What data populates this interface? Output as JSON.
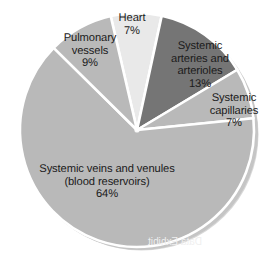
{
  "chart_data": {
    "type": "pie",
    "title": "",
    "subtitle": "",
    "xlabel": "",
    "ylabel": "",
    "grid": false,
    "legend_position": "none",
    "labels_inside_and_outside": true,
    "total_percent": 100,
    "units": "percent of total blood volume",
    "categories": [
      "Heart",
      "Systemic arteries and arterioles",
      "Systemic capillaries",
      "Systemic veins and venules (blood reservoirs)",
      "Pulmonary vessels"
    ],
    "values": [
      7,
      13,
      7,
      64,
      9
    ],
    "slices": [
      {
        "name": "Heart",
        "value": 7,
        "value_label": "7%",
        "label_lines": [
          "Heart"
        ],
        "color": "#e9e9e9",
        "start_angle_deg": -13,
        "end_angle_deg": 12.2,
        "label_placement": "outside-top"
      },
      {
        "name": "Systemic arteries and arterioles",
        "value": 13,
        "value_label": "13%",
        "label_lines": [
          "Systemic",
          "arteries and",
          "arterioles"
        ],
        "color": "#757575",
        "start_angle_deg": 12.2,
        "end_angle_deg": 59,
        "label_placement": "inside"
      },
      {
        "name": "Systemic capillaries",
        "value": 7,
        "value_label": "7%",
        "label_lines": [
          "Systemic",
          "capillaries"
        ],
        "color": "#b9b9b9",
        "start_angle_deg": 59,
        "end_angle_deg": 84.2,
        "label_placement": "outside-right"
      },
      {
        "name": "Systemic veins and venules (blood reservoirs)",
        "value": 64,
        "value_label": "64%",
        "label_lines": [
          "Systemic veins and venules",
          "(blood reservoirs)"
        ],
        "color": "#b9b9b9",
        "start_angle_deg": 84.2,
        "end_angle_deg": 314.6,
        "label_placement": "inside"
      },
      {
        "name": "Pulmonary vessels",
        "value": 9,
        "value_label": "9%",
        "label_lines": [
          "Pulmonary",
          "vessels"
        ],
        "color": "#b9b9b9",
        "start_angle_deg": 314.6,
        "end_angle_deg": 347,
        "label_placement": "inside"
      }
    ],
    "separator_color": "#ffffff",
    "rim_shadow_color": "#b0b0b0",
    "background_color": "#ffffff"
  },
  "labels": {
    "heart": {
      "line1": "Heart",
      "value": "7%"
    },
    "pulmonary": {
      "line1": "Pulmonary",
      "line2": "vessels",
      "value": "9%"
    },
    "arteries": {
      "line1": "Systemic",
      "line2": "arteries and",
      "line3": "arterioles",
      "value": "13%"
    },
    "capillaries": {
      "line1": "Systemic",
      "line2": "capillaries",
      "value": "7%"
    },
    "veins": {
      "line1": "Systemic veins and venules",
      "line2": "(blood reservoirs)",
      "value": "64%"
    }
  },
  "artifacts": {
    "bleed_through_text": "Data Exhibit"
  }
}
